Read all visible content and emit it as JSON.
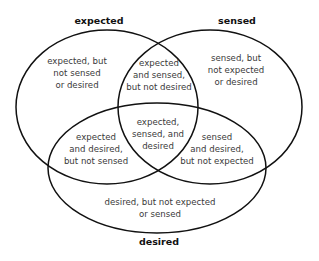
{
  "diagram": {
    "type": "venn",
    "sets": [
      {
        "id": "expected",
        "label": "expected"
      },
      {
        "id": "sensed",
        "label": "sensed"
      },
      {
        "id": "desired",
        "label": "desired"
      }
    ],
    "regions": {
      "expected_only": [
        "expected, but",
        "not sensed",
        "or desired"
      ],
      "sensed_only": [
        "sensed, but",
        "not expected",
        "or desired"
      ],
      "desired_only": [
        "desired, but not expected",
        "or sensed"
      ],
      "expected_sensed": [
        "expected",
        "and sensed,",
        "but not desired"
      ],
      "expected_desired": [
        "expected",
        "and desired,",
        "but not sensed"
      ],
      "sensed_desired": [
        "sensed",
        "and desired,",
        "but not expected"
      ],
      "all_three": [
        "expected,",
        "sensed, and",
        "desired"
      ]
    },
    "colors": {
      "stroke": "#111111",
      "text": "#3a3a3a",
      "background": "#ffffff"
    }
  }
}
